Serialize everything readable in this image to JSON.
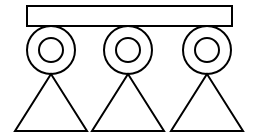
{
  "figure": {
    "canvas": {
      "width": 257,
      "height": 140,
      "background_color": "#ffffff"
    },
    "style": {
      "stroke_color": "#000000",
      "stroke_width": 2,
      "fill": "none"
    },
    "bar": {
      "label": "horizontal-bar",
      "x": 27,
      "y": 6,
      "width": 205,
      "height": 20
    },
    "units": [
      {
        "label": "unit-1",
        "center_x": 51,
        "center_y": 50,
        "outer_radius": 24,
        "inner_radius": 12,
        "triangle_apex_x": 51,
        "triangle_apex_y": 74,
        "triangle_base_y": 131,
        "triangle_base_left_x": 15,
        "triangle_base_right_x": 87
      },
      {
        "label": "unit-2",
        "center_x": 128,
        "center_y": 50,
        "outer_radius": 24,
        "inner_radius": 12,
        "triangle_apex_x": 128,
        "triangle_apex_y": 74,
        "triangle_base_y": 131,
        "triangle_base_left_x": 92,
        "triangle_base_right_x": 164
      },
      {
        "label": "unit-3",
        "center_x": 207,
        "center_y": 50,
        "outer_radius": 24,
        "inner_radius": 12,
        "triangle_apex_x": 207,
        "triangle_apex_y": 74,
        "triangle_base_y": 131,
        "triangle_base_left_x": 171,
        "triangle_base_right_x": 243
      }
    ]
  }
}
